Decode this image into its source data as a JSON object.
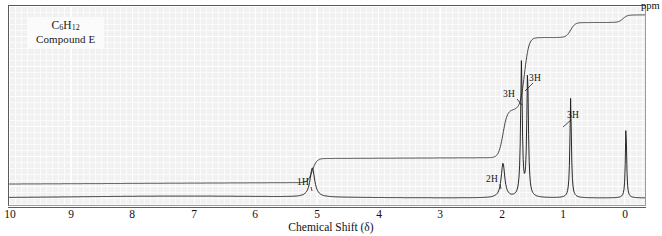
{
  "figure": {
    "kind": "nmr-spectrum",
    "compound_formula": "C6H12",
    "compound_formula_display": "C",
    "formula_parts": {
      "c": "C",
      "c_sub": "6",
      "h": "H",
      "h_sub": "12"
    },
    "compound_name": "Compound E",
    "axis_title": "Chemical Shift (δ)",
    "unit_label": "ppm",
    "background_color": "#f1f1f1",
    "trace_color": "#1d1d1d",
    "grid_color": "#ffffff"
  },
  "chart_data": {
    "type": "line",
    "title": "",
    "subtitle": "Compound E",
    "xlabel": "Chemical Shift (δ)",
    "ylabel": "",
    "xlim": [
      10,
      0
    ],
    "ylim": [
      0,
      100
    ],
    "grid": true,
    "legend": "none",
    "x_ticks": [
      10,
      9,
      8,
      7,
      6,
      5,
      4,
      3,
      2,
      1,
      0
    ],
    "x_tick_labels": [
      "10",
      "9",
      "8",
      "7",
      "6",
      "5",
      "4",
      "3",
      "2",
      "1",
      "0"
    ],
    "series": [
      {
        "name": "1H NMR spectrum",
        "peaks": [
          {
            "shift": 5.1,
            "height": 17,
            "width": 0.045,
            "label": "1H",
            "protons": 1,
            "multiplicity": "multiplet",
            "assignment": "vinyl CH"
          },
          {
            "shift": 2.0,
            "height": 20,
            "width": 0.035,
            "label": "2H",
            "protons": 2,
            "multiplicity": "multiplet",
            "assignment": "allylic CH2"
          },
          {
            "shift": 1.7,
            "height": 78,
            "width": 0.016,
            "label": "3H",
            "protons": 3,
            "multiplicity": "singlet",
            "assignment": "vinyl CH3"
          },
          {
            "shift": 1.6,
            "height": 72,
            "width": 0.016,
            "label": "3H",
            "protons": 3,
            "multiplicity": "singlet",
            "assignment": "vinyl CH3"
          },
          {
            "shift": 0.9,
            "height": 58,
            "width": 0.014,
            "label": "3H",
            "protons": 3,
            "multiplicity": "doublet",
            "assignment": "CH3"
          },
          {
            "shift": 0.0,
            "height": 42,
            "width": 0.012,
            "label": "",
            "protons": 0,
            "multiplicity": "singlet",
            "assignment": "TMS reference"
          }
        ],
        "integration_steps": [
          {
            "shift": 5.1,
            "rise": 13
          },
          {
            "shift": 2.0,
            "rise": 26
          },
          {
            "shift": 1.65,
            "rise": 39
          },
          {
            "shift": 0.9,
            "rise": 8
          },
          {
            "shift": 0.05,
            "rise": 4
          }
        ]
      }
    ],
    "annotations": [
      {
        "text": "1H",
        "x_px": 297,
        "y_px": 177,
        "leader_to_x": 311,
        "leader_to_y": 190
      },
      {
        "text": "2H",
        "x_px": 486,
        "y_px": 174,
        "leader_to_x": 500,
        "leader_to_y": 188
      },
      {
        "text": "3H",
        "x_px": 503,
        "y_px": 89,
        "leader_to_x": 521,
        "leader_to_y": 104
      },
      {
        "text": "3H",
        "x_px": 529,
        "y_px": 73,
        "leader_to_x": 524,
        "leader_to_y": 90
      },
      {
        "text": "3H",
        "x_px": 567,
        "y_px": 110,
        "leader_to_x": 562,
        "leader_to_y": 126
      }
    ]
  },
  "axis": {
    "ticks": [
      {
        "label": "10",
        "x_px": 10
      },
      {
        "label": "9",
        "x_px": 71
      },
      {
        "label": "8",
        "x_px": 132
      },
      {
        "label": "7",
        "x_px": 194
      },
      {
        "label": "6",
        "x_px": 255
      },
      {
        "label": "5",
        "x_px": 317
      },
      {
        "label": "4",
        "x_px": 379
      },
      {
        "label": "3",
        "x_px": 440
      },
      {
        "label": "2",
        "x_px": 502
      },
      {
        "label": "1",
        "x_px": 563
      },
      {
        "label": "0",
        "x_px": 625
      }
    ]
  }
}
